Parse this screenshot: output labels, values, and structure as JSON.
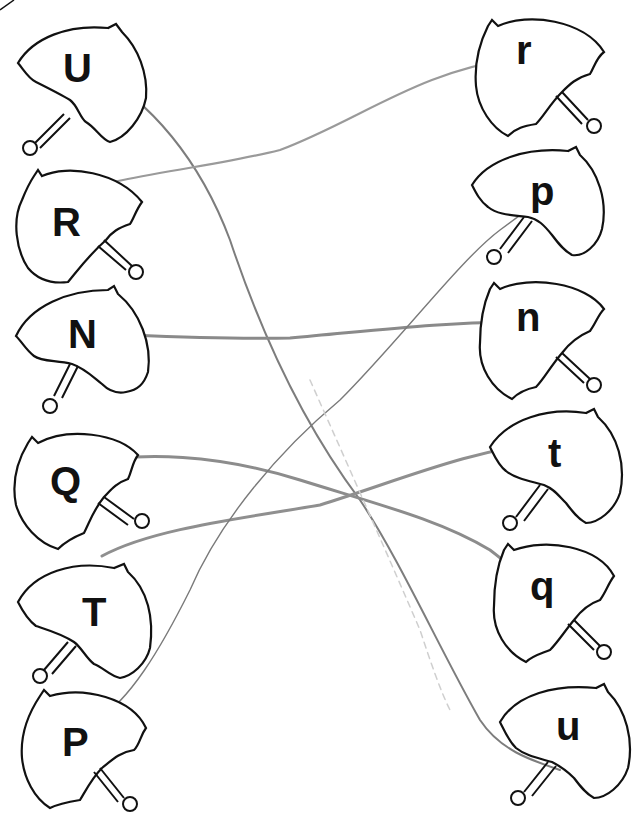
{
  "worksheet": {
    "title": "",
    "left_column": [
      {
        "letter": "U",
        "x": 8,
        "y": 18,
        "flip": false,
        "lx": 62,
        "ly": 48
      },
      {
        "letter": "R",
        "x": 8,
        "y": 160,
        "flip": false,
        "lx": 52,
        "ly": 200
      },
      {
        "letter": "N",
        "x": 8,
        "y": 284,
        "flip": false,
        "lx": 68,
        "ly": 318
      },
      {
        "letter": "Q",
        "x": 8,
        "y": 425,
        "flip": false,
        "lx": 50,
        "ly": 460
      },
      {
        "letter": "T",
        "x": 14,
        "y": 558,
        "flip": false,
        "lx": 80,
        "ly": 592
      },
      {
        "letter": "P",
        "x": 14,
        "y": 688,
        "flip": false,
        "lx": 62,
        "ly": 718
      }
    ],
    "right_column": [
      {
        "letter": "r",
        "x": 464,
        "y": 12,
        "lx": 518,
        "ly": 44
      },
      {
        "letter": "p",
        "x": 468,
        "y": 145,
        "lx": 530,
        "ly": 180
      },
      {
        "letter": "n",
        "x": 476,
        "y": 275,
        "lx": 526,
        "ly": 308
      },
      {
        "letter": "t",
        "x": 486,
        "y": 405,
        "lx": 553,
        "ly": 438
      },
      {
        "letter": "q",
        "x": 490,
        "y": 538,
        "lx": 535,
        "ly": 576
      },
      {
        "letter": "u",
        "x": 496,
        "y": 680,
        "lx": 556,
        "ly": 708
      }
    ],
    "matches": [
      {
        "from": "U",
        "to": "u"
      },
      {
        "from": "R",
        "to": "r"
      },
      {
        "from": "N",
        "to": "n"
      },
      {
        "from": "Q",
        "to": "q"
      },
      {
        "from": "T",
        "to": "t"
      },
      {
        "from": "P",
        "to": "p"
      }
    ],
    "colors": {
      "outline": "#111111",
      "pencil": "#8a8a8a",
      "pencil_dark": "#6e6e6e",
      "background": "#ffffff"
    }
  }
}
